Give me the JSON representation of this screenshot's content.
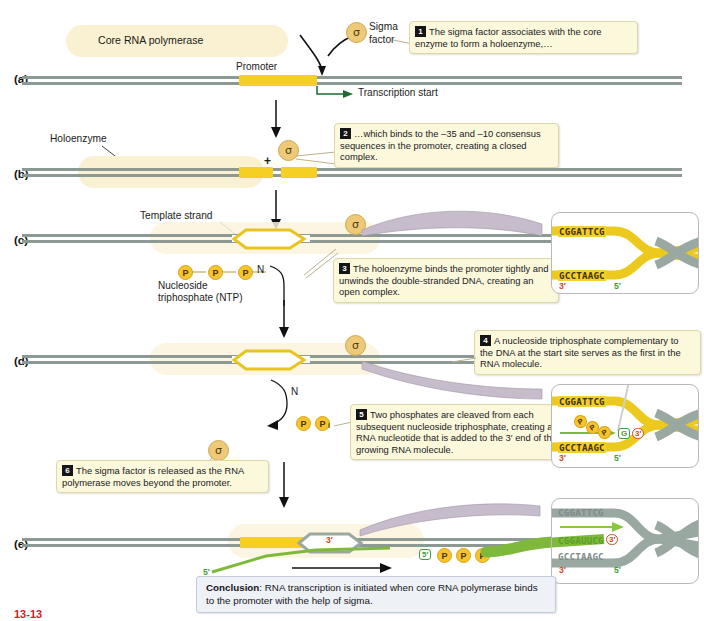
{
  "figure": {
    "tag": "13-13",
    "panels": [
      {
        "letter": "(a)"
      },
      {
        "letter": "(b)"
      },
      {
        "letter": "(c)"
      },
      {
        "letter": "(d)"
      },
      {
        "letter": "(e)"
      }
    ]
  },
  "labels": {
    "core_rna_polymerase": "Core RNA polymerase",
    "sigma_factor_line1": "Sigma",
    "sigma_factor_line2": "factor",
    "sigma_glyph": "σ",
    "promoter": "Promoter",
    "transcription_start": "Transcription start",
    "holoenzyme": "Holoenzyme",
    "template_strand": "Template strand",
    "ntp_line1": "Nucleoside",
    "ntp_line2": "triphosphate (NTP)",
    "plus": "+",
    "nitrogen_base": "N",
    "phosphate": "P",
    "phosphate_i": "i"
  },
  "callouts": [
    {
      "num": "1",
      "text": "The sigma factor associates with the core enzyme to form a holoenzyme,…"
    },
    {
      "num": "2",
      "text": "…which binds to the –35 and –10 consensus sequences in the promoter, creating a closed complex."
    },
    {
      "num": "3",
      "text": "The holoenzyme binds the promoter tightly and unwinds the double-stranded DNA, creating an open complex."
    },
    {
      "num": "4",
      "text": "A nucleoside triphosphate complementary to the DNA at the start site serves as the first in the RNA molecule."
    },
    {
      "num": "5",
      "text": "Two phosphates are cleaved from each subsequent nucleoside triphosphate, creating an RNA nucleotide that is added to the 3′ end of the growing RNA molecule."
    },
    {
      "num": "6",
      "text": "The sigma factor is released as the RNA polymerase moves beyond the promoter."
    }
  ],
  "conclusion": {
    "label": "Conclusion",
    "text": ": RNA transcription is initiated when core RNA polymerase binds to the promoter with the help of sigma."
  },
  "insets": {
    "c": {
      "top_seq": "CGGATTCG",
      "bottom_seq": "GCCTAAGC",
      "left_end": "3′",
      "right_end": "5′"
    },
    "d": {
      "top_seq": "CGGATTCG",
      "bottom_seq": "GCCTAAGC",
      "left_end": "3′",
      "right_end": "5′",
      "nucleotide_base": "G",
      "nucleotide_end": "3′",
      "phosphates": [
        "P",
        "P",
        "P"
      ]
    },
    "e": {
      "top_seq": "CGGATTCG",
      "rna_seq": "CGGAUUCG",
      "rna_end": "3′",
      "bottom_seq": "GCCTAAGC",
      "left_end": "3′",
      "right_end": "5′"
    }
  },
  "panel_e": {
    "rna_5_end": "5′",
    "rna_3_end": "3′",
    "rna_tail_5": "5′",
    "phosphates": [
      "P",
      "P",
      "P"
    ]
  },
  "colors": {
    "dna_strand": "#8d9a94",
    "promoter_yellow": "#f5cf24",
    "enzyme_cream": "#faf0d2",
    "sigma_tan": "#edc978",
    "rna_green": "#7fb93b",
    "callout_bg": "#fcf8dc",
    "conclusion_bg": "#eef1f6",
    "end3_red": "#d2491b",
    "end5_green": "#3f9e3a"
  }
}
